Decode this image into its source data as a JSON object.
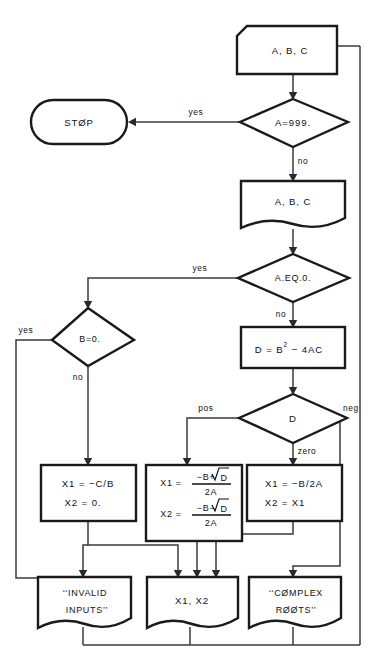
{
  "diagram": {
    "stroke_color": "#1a1a1a",
    "connector_color": "#3a3a3a",
    "background_color": "#ffffff"
  },
  "nodes": {
    "read_input": {
      "label": "A, B, C",
      "shape": "punched-card-input"
    },
    "check_sentinel": {
      "label": "A=999.",
      "shape": "decision"
    },
    "stop": {
      "label": "STØP",
      "shape": "terminator"
    },
    "print_input": {
      "label": "A, B, C",
      "shape": "document-output"
    },
    "check_a_zero": {
      "label": "A.EQ.0.",
      "shape": "decision"
    },
    "check_b_zero": {
      "label": "B=0.",
      "shape": "decision"
    },
    "compute_disc": {
      "shape": "process",
      "label_lhs": "D  =  B",
      "label_exp": "2",
      "label_rhs": "−  4AC",
      "label_plain": "D = B2 − 4AC"
    },
    "check_disc": {
      "label": "D",
      "shape": "decision"
    },
    "linear_root": {
      "shape": "process",
      "line1": "X1  =  −C/B",
      "line2": "X2  =  0."
    },
    "real_roots": {
      "shape": "process",
      "x1_label": "X1  =",
      "x1_num_pre": "−B+",
      "x1_num_rad": "D",
      "x1_den": "2A",
      "x2_label": "X2  =",
      "x2_num_pre": "−B−",
      "x2_num_rad": "D",
      "x2_den": "2A",
      "plain": "X1 = (−B+√D)/2A ; X2 = (−B−√D)/2A"
    },
    "equal_roots": {
      "shape": "process",
      "line1": "X1  =  −B/2A",
      "line2": "X2  =  X1"
    },
    "print_invalid": {
      "shape": "document-output",
      "line1": "‘‘INVALID",
      "line2": "INPUTS’’"
    },
    "print_roots": {
      "shape": "document-output",
      "label": "X1,  X2"
    },
    "print_complex": {
      "shape": "document-output",
      "line1": "‘‘CØMPLEX",
      "line2": "RØØTS’’"
    }
  },
  "branch_labels": {
    "sentinel_yes": "yes",
    "sentinel_no": "no",
    "a_zero_yes": "yes",
    "a_zero_no": "no",
    "b_zero_yes": "yes",
    "b_zero_no": "no",
    "disc_pos": "pos",
    "disc_zero": "zero",
    "disc_neg": "neg"
  }
}
